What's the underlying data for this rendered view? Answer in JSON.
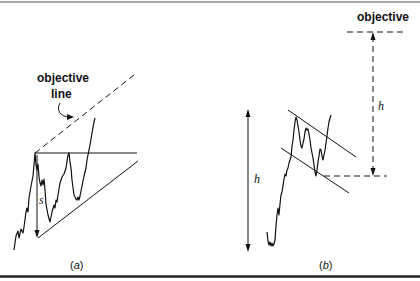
{
  "figure": {
    "panels": [
      {
        "id": "a",
        "caption_open": "(",
        "caption_letter": "a",
        "caption_close": ")",
        "pattern": "ascending triangle",
        "labels": {
          "objective_line_line1": "objective",
          "objective_line_line2": "line",
          "height_symbol": "s"
        }
      },
      {
        "id": "b",
        "caption_open": "(",
        "caption_letter": "b",
        "caption_close": ")",
        "pattern": "flag",
        "labels": {
          "objective": "objective",
          "height_symbol_left": "h",
          "height_symbol_right": "h"
        }
      }
    ],
    "colors": {
      "ink": "#111111",
      "background": "#ffffff",
      "border": "#333333"
    }
  }
}
